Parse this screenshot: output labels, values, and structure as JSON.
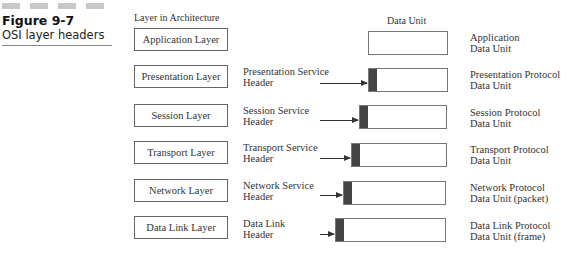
{
  "figure": {
    "number": "Figure 9-7",
    "caption": "OSI layer headers"
  },
  "columns": {
    "layer": "Layer in Architecture",
    "data_unit": "Data Unit"
  },
  "rows": [
    {
      "layer": "Application Layer",
      "header_line1": "",
      "header_line2": "",
      "pdu_line1": "Application",
      "pdu_line2": "Data Unit"
    },
    {
      "layer": "Presentation Layer",
      "header_line1": "Presentation Service",
      "header_line2": "Header",
      "pdu_line1": "Presentation Protocol",
      "pdu_line2": "Data Unit"
    },
    {
      "layer": "Session Layer",
      "header_line1": "Session Service",
      "header_line2": "Header",
      "pdu_line1": "Session Protocol",
      "pdu_line2": "Data Unit"
    },
    {
      "layer": "Transport Layer",
      "header_line1": "Transport Service",
      "header_line2": "Header",
      "pdu_line1": "Transport Protocol",
      "pdu_line2": "Data Unit"
    },
    {
      "layer": "Network Layer",
      "header_line1": "Network Service",
      "header_line2": "Header",
      "pdu_line1": "Network Protocol",
      "pdu_line2": "Data Unit (packet)"
    },
    {
      "layer": "Data Link Layer",
      "header_line1": "Data Link",
      "header_line2": "Header",
      "pdu_line1": "Data Link Protocol",
      "pdu_line2": "Data Unit (frame)"
    }
  ]
}
